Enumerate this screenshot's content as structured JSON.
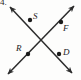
{
  "figure": {
    "problem_number": "4.",
    "stroke_color": "#2b2b2b",
    "dot_color": "#1a1a1a",
    "background_color": "#fdfdfc",
    "lines": [
      {
        "name": "line-SD",
        "description": "double-headed arrow from upper-left to lower-right",
        "x1": 10,
        "y1": 7,
        "x2": 72,
        "y2": 73
      },
      {
        "name": "line-RF",
        "description": "double-headed arrow from lower-left to upper-right",
        "x1": 8,
        "y1": 74,
        "x2": 74,
        "y2": 6
      }
    ],
    "points": [
      {
        "label": "S",
        "x": 30,
        "y": 20,
        "ray": "upper-left"
      },
      {
        "label": "F",
        "x": 61,
        "y": 22,
        "ray": "upper-right"
      },
      {
        "label": "R",
        "x": 28,
        "y": 54,
        "ray": "lower-left"
      },
      {
        "label": "D",
        "x": 59,
        "y": 54,
        "ray": "lower-right"
      }
    ],
    "intersection": {
      "x": 41,
      "y": 40
    }
  }
}
